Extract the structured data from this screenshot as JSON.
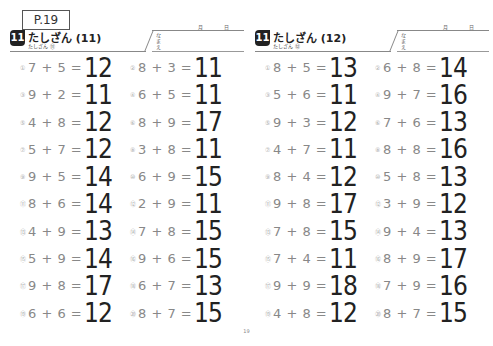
{
  "page_label": "P.19",
  "footer_page": "19",
  "sheets": [
    {
      "badge": "11",
      "title": "たしざん (11)",
      "subtitle": "たしざん ⑪",
      "name_label": "なまえ",
      "month_label": "月",
      "day_label": "日",
      "problems": [
        {
          "n": "①",
          "eq": "7 + 5 =",
          "ans": "12"
        },
        {
          "n": "②",
          "eq": "8 + 3 =",
          "ans": "11"
        },
        {
          "n": "③",
          "eq": "9 + 2 =",
          "ans": "11"
        },
        {
          "n": "④",
          "eq": "6 + 5 =",
          "ans": "11"
        },
        {
          "n": "⑤",
          "eq": "4 + 8 =",
          "ans": "12"
        },
        {
          "n": "⑥",
          "eq": "8 + 9 =",
          "ans": "17"
        },
        {
          "n": "⑦",
          "eq": "5 + 7 =",
          "ans": "12"
        },
        {
          "n": "⑧",
          "eq": "3 + 8 =",
          "ans": "11"
        },
        {
          "n": "⑨",
          "eq": "9 + 5 =",
          "ans": "14"
        },
        {
          "n": "⑩",
          "eq": "6 + 9 =",
          "ans": "15"
        },
        {
          "n": "⑪",
          "eq": "8 + 6 =",
          "ans": "14"
        },
        {
          "n": "⑫",
          "eq": "2 + 9 =",
          "ans": "11"
        },
        {
          "n": "⑬",
          "eq": "4 + 9 =",
          "ans": "13"
        },
        {
          "n": "⑭",
          "eq": "7 + 8 =",
          "ans": "15"
        },
        {
          "n": "⑮",
          "eq": "5 + 9 =",
          "ans": "14"
        },
        {
          "n": "⑯",
          "eq": "9 + 6 =",
          "ans": "15"
        },
        {
          "n": "⑰",
          "eq": "9 + 8 =",
          "ans": "17"
        },
        {
          "n": "⑱",
          "eq": "6 + 7 =",
          "ans": "13"
        },
        {
          "n": "⑲",
          "eq": "6 + 6 =",
          "ans": "12"
        },
        {
          "n": "⑳",
          "eq": "8 + 7 =",
          "ans": "15"
        }
      ]
    },
    {
      "badge": "11",
      "title": "たしざん (12)",
      "subtitle": "たしざん ⑫",
      "name_label": "なまえ",
      "month_label": "月",
      "day_label": "日",
      "problems": [
        {
          "n": "①",
          "eq": "8 + 5 =",
          "ans": "13"
        },
        {
          "n": "②",
          "eq": "6 + 8 =",
          "ans": "14"
        },
        {
          "n": "③",
          "eq": "5 + 6 =",
          "ans": "11"
        },
        {
          "n": "④",
          "eq": "9 + 7 =",
          "ans": "16"
        },
        {
          "n": "⑤",
          "eq": "9 + 3 =",
          "ans": "12"
        },
        {
          "n": "⑥",
          "eq": "7 + 6 =",
          "ans": "13"
        },
        {
          "n": "⑦",
          "eq": "4 + 7 =",
          "ans": "11"
        },
        {
          "n": "⑧",
          "eq": "8 + 8 =",
          "ans": "16"
        },
        {
          "n": "⑨",
          "eq": "8 + 4 =",
          "ans": "12"
        },
        {
          "n": "⑩",
          "eq": "5 + 8 =",
          "ans": "13"
        },
        {
          "n": "⑪",
          "eq": "9 + 8 =",
          "ans": "17"
        },
        {
          "n": "⑫",
          "eq": "3 + 9 =",
          "ans": "12"
        },
        {
          "n": "⑬",
          "eq": "7 + 8 =",
          "ans": "15"
        },
        {
          "n": "⑭",
          "eq": "9 + 4 =",
          "ans": "13"
        },
        {
          "n": "⑮",
          "eq": "7 + 4 =",
          "ans": "11"
        },
        {
          "n": "⑯",
          "eq": "8 + 9 =",
          "ans": "17"
        },
        {
          "n": "⑰",
          "eq": "9 + 9 =",
          "ans": "18"
        },
        {
          "n": "⑱",
          "eq": "7 + 9 =",
          "ans": "16"
        },
        {
          "n": "⑲",
          "eq": "4 + 8 =",
          "ans": "12"
        },
        {
          "n": "⑳",
          "eq": "8 + 7 =",
          "ans": "15"
        }
      ]
    }
  ]
}
